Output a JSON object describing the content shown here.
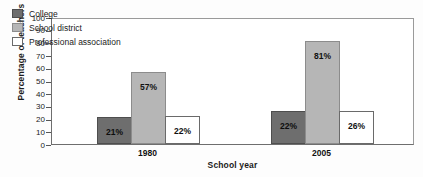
{
  "chart_data": {
    "type": "bar",
    "title": "",
    "xlabel": "School year",
    "ylabel": "Percentage of teachers",
    "categories": [
      "1980",
      "2005"
    ],
    "series": [
      {
        "name": "College",
        "color": "#6e6e6e",
        "values": [
          21,
          26
        ],
        "labels": [
          "21%",
          "22%"
        ]
      },
      {
        "name": "School district",
        "color": "#b6b6b6",
        "values": [
          57,
          81
        ],
        "labels": [
          "57%",
          "81%"
        ]
      },
      {
        "name": "Professional association",
        "color": "#ffffff",
        "values": [
          22,
          26
        ],
        "labels": [
          "22%",
          "26%"
        ]
      }
    ],
    "point_labels": {
      "1980": {
        "College": "21%",
        "School district": "57%",
        "Professional association": "22%"
      },
      "2005": {
        "College": "26%",
        "School district": "81%",
        "Professional association": "26%"
      }
    },
    "ylim": [
      0,
      100
    ],
    "ytick_step": 10,
    "yticks": [
      "100",
      "90",
      "80",
      "70",
      "60",
      "50",
      "40",
      "30",
      "20",
      "10",
      "0"
    ],
    "grid": false,
    "legend_position": "top-left"
  },
  "legend": {
    "items": [
      {
        "label": "College",
        "swatch": "series-college"
      },
      {
        "label": "School district",
        "swatch": "series-district"
      },
      {
        "label": "Professional association",
        "swatch": "series-association"
      }
    ]
  },
  "axes": {
    "y_title": "Percentage of teachers",
    "x_title": "School year"
  }
}
